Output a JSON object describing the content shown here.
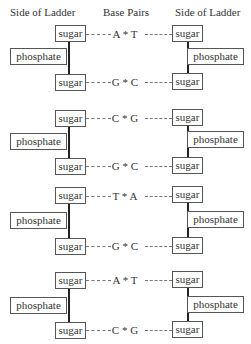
{
  "headers": {
    "left": "Side of Ladder",
    "middle": "Base Pairs",
    "right": "Side of Ladder"
  },
  "labels": {
    "sugar": "sugar",
    "phosphate": "phosphate"
  },
  "groups": [
    {
      "top_pair": "A * T",
      "bottom_pair": "G * C"
    },
    {
      "top_pair": "C * G",
      "bottom_pair": "G * C"
    },
    {
      "top_pair": "T * A",
      "bottom_pair": "G * C"
    },
    {
      "top_pair": "A * T",
      "bottom_pair": "C * G"
    }
  ]
}
